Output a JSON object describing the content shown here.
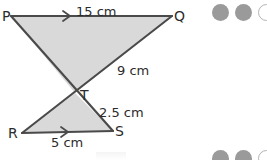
{
  "figure": {
    "background_color": "#ffffff",
    "fill_color": "#d9d9d9",
    "stroke_color": "#4a4a4a",
    "text_color": "#2b2b2b",
    "vertices": [
      {
        "name": "P",
        "label": "P",
        "x": 11,
        "y": 16
      },
      {
        "name": "Q",
        "label": "Q",
        "x": 172,
        "y": 16
      },
      {
        "name": "T",
        "label": "T",
        "x": 75,
        "y": 93
      },
      {
        "name": "R",
        "label": "R",
        "x": 22,
        "y": 133
      },
      {
        "name": "S",
        "label": "S",
        "x": 113,
        "y": 131
      }
    ],
    "vertex_labels": [
      {
        "name": "P",
        "text": "P",
        "left": 2,
        "top": 9
      },
      {
        "name": "Q",
        "text": "Q",
        "left": 174,
        "top": 9
      },
      {
        "name": "T",
        "text": "T",
        "left": 80,
        "top": 88
      },
      {
        "name": "R",
        "text": "R",
        "left": 8,
        "top": 126
      },
      {
        "name": "S",
        "text": "S",
        "left": 115,
        "top": 124
      }
    ],
    "measurements": [
      {
        "name": "pq",
        "text": "15 cm",
        "left": 76,
        "top": 5,
        "segment": "PQ"
      },
      {
        "name": "qt",
        "text": "9 cm",
        "left": 117,
        "top": 64,
        "segment": "QT"
      },
      {
        "name": "ts",
        "text": "2.5 cm",
        "left": 99,
        "top": 106,
        "segment": "TS"
      },
      {
        "name": "rs",
        "text": "5 cm",
        "left": 51,
        "top": 136,
        "segment": "RS"
      }
    ],
    "arrow_markers": [
      {
        "name": "pq-direction-arrow",
        "x": 68,
        "y": 16,
        "direction": "right"
      },
      {
        "name": "rs-direction-arrow",
        "x": 66,
        "y": 132,
        "direction": "right"
      }
    ]
  },
  "decorations": {
    "top_right_dots": [
      {
        "name": "dot-1",
        "style": "filled"
      },
      {
        "name": "dot-2",
        "style": "filled"
      },
      {
        "name": "dot-3",
        "style": "hollow"
      }
    ],
    "bottom_right_dots": [
      {
        "name": "dot-1",
        "style": "filled"
      },
      {
        "name": "dot-2",
        "style": "filled"
      },
      {
        "name": "dot-3",
        "style": "hollow"
      }
    ]
  }
}
